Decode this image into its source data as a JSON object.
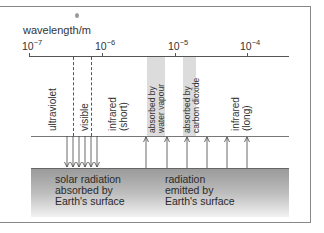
{
  "axis": {
    "title": "wavelength/m",
    "ticks": [
      {
        "base": "10",
        "exp": "−7",
        "x": 29
      },
      {
        "base": "10",
        "exp": "−6",
        "x": 102
      },
      {
        "base": "10",
        "exp": "−5",
        "x": 175
      },
      {
        "base": "10",
        "exp": "−4",
        "x": 247
      }
    ]
  },
  "regions": {
    "ultraviolet": "ultraviolet",
    "visible": "visible",
    "infrared_short_1": "infrared",
    "infrared_short_2": "(short)",
    "water_vapour_1": "absorbed by",
    "water_vapour_2": "water vapour",
    "co2_1": "absorbed by",
    "co2_2": "carbon dioxide",
    "infrared_long_1": "infrared",
    "infrared_long_2": "(long)"
  },
  "ground": {
    "left_1": "solar radiation",
    "left_2": "absorbed by",
    "left_3": "Earth's surface",
    "right_1": "radiation",
    "right_2": "emitted by",
    "right_3": "Earth's surface"
  },
  "arrows": {
    "down_x": [
      67,
      73,
      79,
      85,
      91,
      97
    ],
    "up_x": [
      146,
      167,
      187,
      207,
      227,
      247
    ]
  },
  "colors": {
    "band": "#dcdcdc",
    "line": "#555555"
  }
}
